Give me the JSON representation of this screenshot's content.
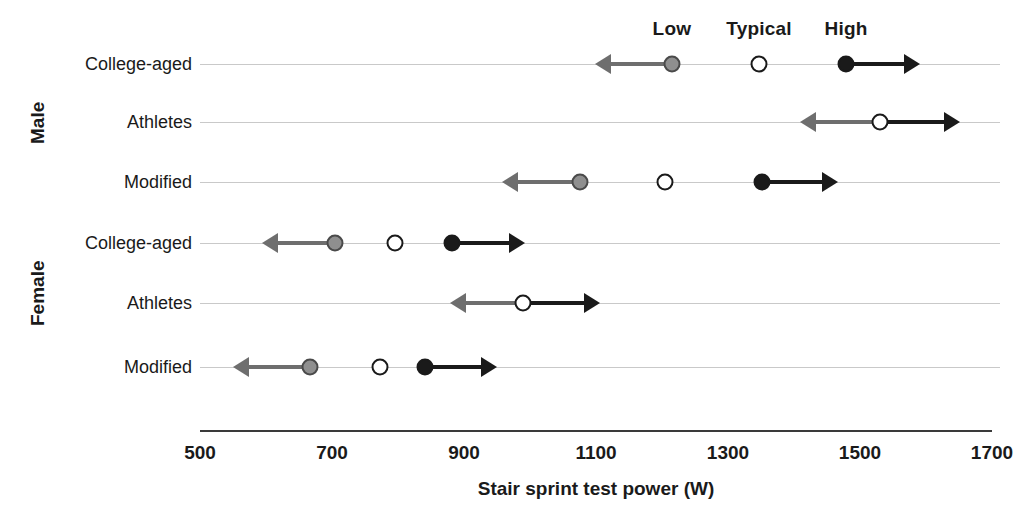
{
  "chart_data": {
    "type": "scatter",
    "title": "",
    "xlabel": "Stair sprint test power (W)",
    "ylabel": "",
    "xlim": [
      500,
      1700
    ],
    "xticks": [
      500,
      700,
      900,
      1100,
      1300,
      1500,
      1700
    ],
    "xtick_labels": [
      "500",
      "700",
      "900",
      "1100",
      "1300",
      "1500",
      "1700"
    ],
    "grid": true,
    "legend_position": "top",
    "legend": [
      {
        "name": "Low",
        "marker": "gray-filled-circle",
        "color": "#8f8f8f",
        "x": 1215
      },
      {
        "name": "Typical",
        "marker": "open-circle",
        "color": "#ffffff",
        "x": 1347
      },
      {
        "name": "High",
        "marker": "black-filled-circle",
        "color": "#1a1a1a",
        "x": 1479
      }
    ],
    "groups": [
      {
        "name": "Male",
        "categories": [
          {
            "label": "College-aged",
            "low": 1215,
            "typical": 1347,
            "high": 1479,
            "low_arrow_to": 1098,
            "high_arrow_to": 1591
          },
          {
            "label": "Athletes",
            "low": null,
            "typical": 1530,
            "high": null,
            "low_arrow_to": 1409,
            "high_arrow_to": 1652
          },
          {
            "label": "Modified",
            "low": 1076,
            "typical": 1205,
            "high": 1352,
            "low_arrow_to": 958,
            "high_arrow_to": 1467
          }
        ]
      },
      {
        "name": "Female",
        "categories": [
          {
            "label": "College-aged",
            "low": 705,
            "typical": 795,
            "high": 882,
            "low_arrow_to": 594,
            "high_arrow_to": 992
          },
          {
            "label": "Athletes",
            "low": null,
            "typical": 989,
            "high": null,
            "low_arrow_to": 879,
            "high_arrow_to": 1106
          },
          {
            "label": "Modified",
            "low": 667,
            "typical": 773,
            "high": 841,
            "low_arrow_to": 550,
            "high_arrow_to": 950
          }
        ]
      }
    ]
  },
  "colors": {
    "low": "#8f8f8f",
    "typical": "#ffffff",
    "high": "#1a1a1a",
    "low_arrow": "#6e6e6e",
    "high_arrow": "#1a1a1a",
    "grid": "#c9c9c9",
    "axis": "#3a3a3a",
    "text": "#1a1a1a"
  }
}
